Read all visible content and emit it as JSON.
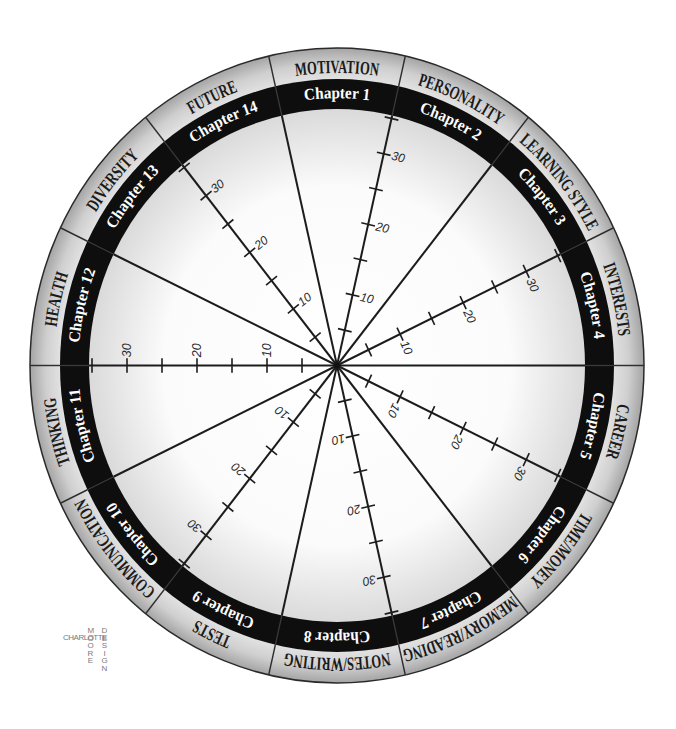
{
  "wheel": {
    "segments": [
      {
        "chapter": "Chapter 1",
        "topic": "MOTIVATION"
      },
      {
        "chapter": "Chapter 2",
        "topic": "PERSONALITY"
      },
      {
        "chapter": "Chapter 3",
        "topic": "LEARNING STYLE"
      },
      {
        "chapter": "Chapter 4",
        "topic": "INTERESTS"
      },
      {
        "chapter": "Chapter 5",
        "topic": "CAREER"
      },
      {
        "chapter": "Chapter 6",
        "topic": "TIME/MONEY"
      },
      {
        "chapter": "Chapter 7",
        "topic": "MEMORY/READING"
      },
      {
        "chapter": "Chapter 8",
        "topic": "NOTES/WRITING"
      },
      {
        "chapter": "Chapter 9",
        "topic": "TESTS"
      },
      {
        "chapter": "Chapter 10",
        "topic": "COMMUNICATION"
      },
      {
        "chapter": "Chapter 11",
        "topic": "THINKING"
      },
      {
        "chapter": "Chapter 12",
        "topic": "HEALTH"
      },
      {
        "chapter": "Chapter 13",
        "topic": "DIVERSITY"
      },
      {
        "chapter": "Chapter 14",
        "topic": "FUTURE"
      }
    ],
    "scale_labels": [
      "10",
      "20",
      "30"
    ],
    "colors": {
      "outer_ring_light": "#e4e4e4",
      "outer_ring_dark": "#a6a6a6",
      "chapter_band": "#0e0e0e",
      "chapter_text": "#ffffff",
      "topic_text": "#1a1a1a",
      "spoke": "#1c1c1c",
      "scale_text": "#2a2a2a"
    }
  },
  "logo": {
    "horizontal": "CHARLOTTE",
    "vertical_left": "MOORE",
    "vertical_right": "DESIGN"
  }
}
